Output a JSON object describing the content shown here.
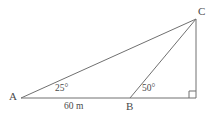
{
  "figure": {
    "type": "geometry-diagram",
    "background_color": "#ffffff",
    "stroke_color": "#707070",
    "text_color": "#4a4a4a",
    "width": 214,
    "height": 120
  },
  "vertices": [
    {
      "id": "A",
      "label": "A",
      "x": 21,
      "y": 98,
      "label_x": 9,
      "label_y": 91
    },
    {
      "id": "B",
      "label": "B",
      "x": 130,
      "y": 98,
      "label_x": 126,
      "label_y": 101
    },
    {
      "id": "C",
      "label": "C",
      "x": 196,
      "y": 19,
      "label_x": 198,
      "label_y": 6
    },
    {
      "id": "D",
      "label": "",
      "x": 196,
      "y": 98,
      "label_x": 0,
      "label_y": 0
    }
  ],
  "segments": [
    {
      "name": "segment-AC",
      "from": "A",
      "to": "C"
    },
    {
      "name": "segment-AD",
      "from": "A",
      "to": "D"
    },
    {
      "name": "segment-BC",
      "from": "B",
      "to": "C"
    },
    {
      "name": "segment-CD",
      "from": "C",
      "to": "D"
    }
  ],
  "angles": [
    {
      "name": "angle-at-A",
      "label": "25°",
      "vertex": "A",
      "x": 55,
      "y": 84
    },
    {
      "name": "angle-at-B",
      "label": "50°",
      "vertex": "B",
      "x": 142,
      "y": 84
    }
  ],
  "right_angle": {
    "name": "right-angle-marker",
    "vertex": "D",
    "size": 7
  },
  "measurements": [
    {
      "name": "base-length-AB",
      "label": "60 m",
      "x": 64,
      "y": 102
    }
  ]
}
